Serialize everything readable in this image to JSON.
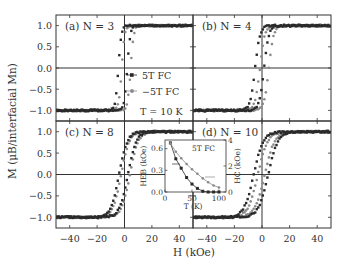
{
  "chart_data": {
    "type": "scatter",
    "title": "",
    "xlabel": "H (kOe)",
    "ylabel": "M (μB/interfacial Mn)",
    "xlim": [
      -50,
      50
    ],
    "ylim": [
      -1.25,
      1.25
    ],
    "x_ticks": [
      -40,
      -20,
      0,
      20,
      40
    ],
    "y_ticks": [
      1.0,
      0.5,
      0.0,
      -0.5,
      -1.0
    ],
    "y_tick_labels": [
      "1.0",
      "0.5",
      "0.0",
      "−0.5",
      "−1.0"
    ],
    "x_tick_labels": [
      "−40",
      "−20",
      "0",
      "20",
      "40"
    ],
    "legend": {
      "position": "inside panel (a), right",
      "entries": [
        {
          "label": "5T FC",
          "color": "#2a2a2a",
          "marker": "square"
        },
        {
          "label": "−5T FC",
          "color": "#8a8a8a",
          "marker": "circle"
        }
      ],
      "annotation": "T = 10 K"
    },
    "panels": [
      {
        "id": "a",
        "label": "(a) N = 3",
        "series": [
          {
            "name": "5T FC",
            "color": "#2a2a2a",
            "coercive_left": -4.5,
            "coercive_right": 2.0,
            "width": 2.2
          },
          {
            "name": "−5T FC",
            "color": "#8a8a8a",
            "coercive_left": -2.0,
            "coercive_right": 4.5,
            "width": 2.2
          }
        ]
      },
      {
        "id": "b",
        "label": "(b) N = 4",
        "series": [
          {
            "name": "5T FC",
            "color": "#2a2a2a",
            "coercive_left": -5.0,
            "coercive_right": 1.5,
            "width": 3.5
          },
          {
            "name": "−5T FC",
            "color": "#8a8a8a",
            "coercive_left": -1.5,
            "coercive_right": 5.0,
            "width": 3.5
          }
        ]
      },
      {
        "id": "c",
        "label": "(c) N = 8",
        "series": [
          {
            "name": "5T FC",
            "color": "#2a2a2a",
            "coercive_left": -4.0,
            "coercive_right": 2.5,
            "width": 6.0
          },
          {
            "name": "−5T FC",
            "color": "#8a8a8a",
            "coercive_left": -2.5,
            "coercive_right": 4.0,
            "width": 6.0
          }
        ]
      },
      {
        "id": "d",
        "label": "(d) N = 10",
        "series": [
          {
            "name": "5T FC",
            "color": "#2a2a2a",
            "coercive_left": -6.0,
            "coercive_right": 4.5,
            "width": 7.0
          },
          {
            "name": "−5T FC",
            "color": "#8a8a8a",
            "coercive_left": -3.0,
            "coercive_right": 2.0,
            "width": 7.0
          }
        ]
      }
    ],
    "inset": {
      "title": "5T FC",
      "xlabel": "T (K)",
      "ylabel_left": "H_EB (kOe)",
      "ylabel_right": "H_C (kOe)",
      "xlim": [
        0,
        113
      ],
      "ylim_left": [
        0,
        0.72
      ],
      "ylim_right": [
        0,
        4
      ],
      "x_ticks": [
        0,
        50,
        100
      ],
      "y_ticks_left": [
        0.0,
        0.3,
        0.6
      ],
      "y_tick_labels_left": [
        "0.0",
        "0.3",
        "0.6"
      ],
      "y_ticks_right": [
        0,
        2,
        4
      ],
      "series": [
        {
          "name": "H_EB",
          "axis": "left",
          "color": "#2a2a2a",
          "marker": "square",
          "x": [
            10,
            20,
            30,
            40,
            50,
            60,
            70,
            80,
            90,
            100
          ],
          "y": [
            0.68,
            0.46,
            0.33,
            0.2,
            0.11,
            0.05,
            0.01,
            0.0,
            0.0,
            0.0
          ]
        },
        {
          "name": "H_C",
          "axis": "right",
          "color": "#8a8a8a",
          "marker": "circle",
          "x": [
            10,
            20,
            30,
            40,
            50,
            60,
            70,
            80,
            90,
            100
          ],
          "y": [
            3.75,
            3.1,
            2.6,
            2.15,
            1.75,
            1.4,
            1.05,
            0.75,
            0.5,
            0.35
          ]
        }
      ]
    },
    "grid": false
  }
}
